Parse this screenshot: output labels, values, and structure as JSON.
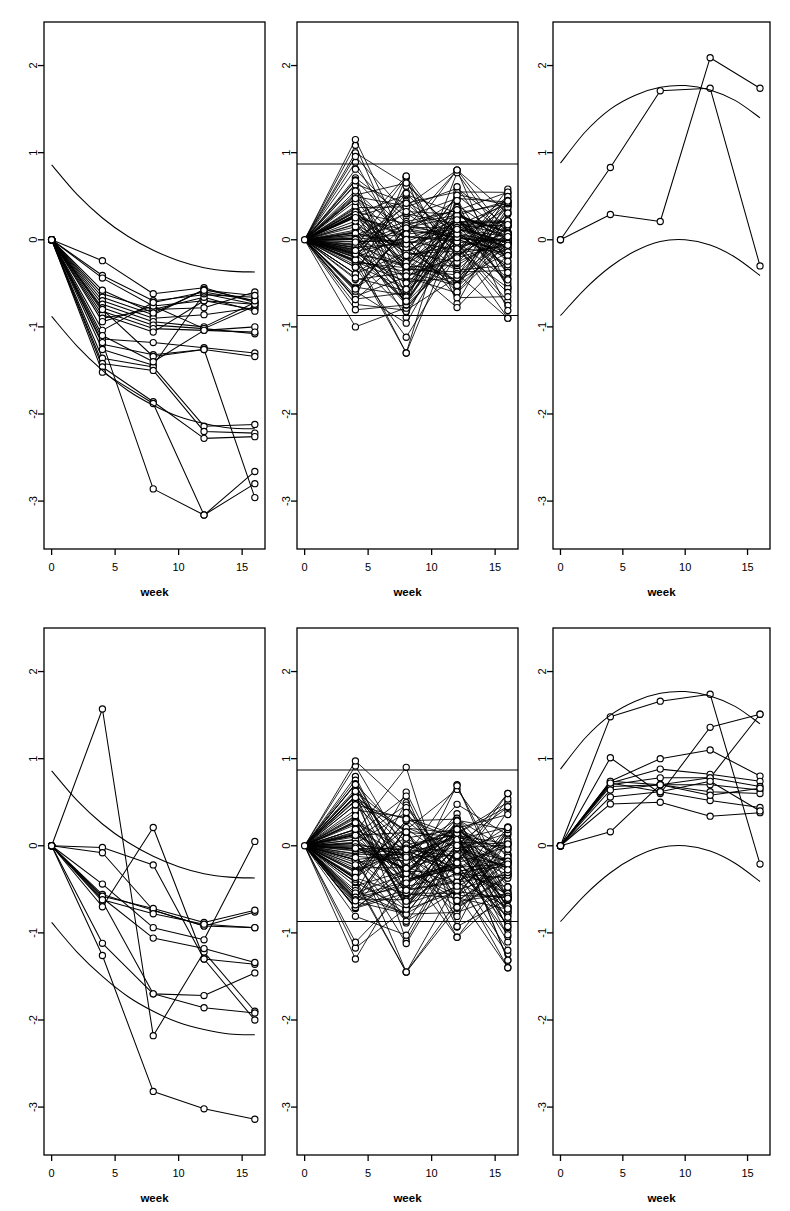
{
  "figure": {
    "panel_rows": 2,
    "panel_cols": 3,
    "background": "#ffffff",
    "ink": "#000000"
  },
  "chart_data": [
    {
      "id": "panel-top-left",
      "type": "line",
      "title": "",
      "xlabel": "week",
      "ylabel": "",
      "xlim": [
        -0.6,
        16.8
      ],
      "ylim": [
        -3.55,
        2.5
      ],
      "xticks": [
        0,
        5,
        10,
        15
      ],
      "xticklabels": [
        "0",
        "5",
        "10",
        "15"
      ],
      "yticks": [
        2,
        1,
        0,
        -1,
        -2,
        -3
      ],
      "yticklabels": [
        "2",
        "1",
        "0",
        "-1",
        "-2",
        "-3"
      ],
      "grid": false,
      "legend": "none",
      "marker": "open-circle",
      "x": [
        0,
        4,
        8,
        12,
        16
      ],
      "envelopes": [
        {
          "name": "upper",
          "x": [
            0,
            2,
            4,
            6,
            8,
            10,
            12,
            14,
            16
          ],
          "y": [
            0.86,
            0.52,
            0.25,
            0.04,
            -0.12,
            -0.24,
            -0.32,
            -0.36,
            -0.37
          ]
        },
        {
          "name": "lower",
          "x": [
            0,
            2,
            4,
            6,
            8,
            10,
            12,
            14,
            16
          ],
          "y": [
            -0.88,
            -1.22,
            -1.5,
            -1.73,
            -1.9,
            -2.03,
            -2.11,
            -2.16,
            -2.17
          ]
        }
      ],
      "series": [
        {
          "name": "s1",
          "values": [
            0,
            -0.24,
            -0.62,
            -0.55,
            -0.72
          ]
        },
        {
          "name": "s2",
          "values": [
            0,
            -0.41,
            -0.7,
            -0.63,
            -0.66
          ]
        },
        {
          "name": "s3",
          "values": [
            0,
            -0.44,
            -0.76,
            -0.7,
            -0.74
          ]
        },
        {
          "name": "s4",
          "values": [
            0,
            -0.62,
            -0.8,
            -0.78,
            -0.6
          ]
        },
        {
          "name": "s5",
          "values": [
            0,
            -0.66,
            -0.86,
            -0.57,
            -0.7
          ]
        },
        {
          "name": "s6",
          "values": [
            0,
            -0.7,
            -0.9,
            -0.86,
            -0.78
          ]
        },
        {
          "name": "s7",
          "values": [
            0,
            -0.74,
            -0.94,
            -1.0,
            -0.72
          ]
        },
        {
          "name": "s8",
          "values": [
            0,
            -0.78,
            -0.98,
            -1.02,
            -0.76
          ]
        },
        {
          "name": "s9",
          "values": [
            0,
            -0.82,
            -1.02,
            -1.04,
            -1.0
          ]
        },
        {
          "name": "s10",
          "values": [
            0,
            -0.86,
            -1.06,
            -0.7,
            -0.8
          ]
        },
        {
          "name": "s11",
          "values": [
            0,
            -0.9,
            -0.8,
            -0.66,
            -0.82
          ]
        },
        {
          "name": "s12",
          "values": [
            0,
            -0.94,
            -0.76,
            -1.02,
            -1.08
          ]
        },
        {
          "name": "s13",
          "values": [
            0,
            -1.14,
            -1.18,
            -1.24,
            -1.3
          ]
        },
        {
          "name": "s14",
          "values": [
            0,
            -1.2,
            -1.32,
            -1.26,
            -1.34
          ]
        },
        {
          "name": "s15",
          "values": [
            0,
            -1.26,
            -1.44,
            -0.62,
            -0.74
          ]
        },
        {
          "name": "s16",
          "values": [
            0,
            -1.36,
            -1.46,
            -2.14,
            -2.12
          ]
        },
        {
          "name": "s17",
          "values": [
            0,
            -1.42,
            -1.5,
            -2.2,
            -2.22
          ]
        },
        {
          "name": "s18",
          "values": [
            0,
            -1.46,
            -1.86,
            -2.28,
            -2.26
          ]
        },
        {
          "name": "s19",
          "values": [
            0,
            -1.52,
            -1.88,
            -3.16,
            -2.66
          ]
        },
        {
          "name": "s20",
          "values": [
            0,
            -1.18,
            -2.86,
            -3.16,
            -2.8
          ]
        },
        {
          "name": "s21",
          "values": [
            0,
            -0.8,
            -1.34,
            -1.26,
            -2.96
          ]
        },
        {
          "name": "s22",
          "values": [
            0,
            -1.04,
            -0.72,
            -0.6,
            -0.7
          ]
        },
        {
          "name": "s23",
          "values": [
            0,
            -0.58,
            -0.84,
            -0.58,
            -0.64
          ]
        },
        {
          "name": "s24",
          "values": [
            0,
            -1.1,
            -1.4,
            -1.04,
            -1.06
          ]
        }
      ]
    },
    {
      "id": "panel-top-middle",
      "type": "line",
      "title": "",
      "xlabel": "week",
      "ylabel": "",
      "xlim": [
        -0.6,
        16.8
      ],
      "ylim": [
        -3.55,
        2.5
      ],
      "xticks": [
        0,
        5,
        10,
        15
      ],
      "xticklabels": [
        "0",
        "5",
        "10",
        "15"
      ],
      "yticks": [
        2,
        1,
        0,
        -1,
        -2,
        -3
      ],
      "yticklabels": [
        "2",
        "1",
        "0",
        "-1",
        "-2",
        "-3"
      ],
      "grid": false,
      "legend": "none",
      "marker": "open-circle",
      "x": [
        0,
        4,
        8,
        12,
        16
      ],
      "reference_lines": [
        0.87,
        -0.87
      ],
      "spaghetti_note": "dense null-simulation bundle, ~100 trajectories spreading from 0 within roughly +/-1.3",
      "n_series": 100,
      "spread": {
        "week4": [
          -1.0,
          1.15
        ],
        "week8": [
          -1.3,
          1.0
        ],
        "week12": [
          -0.9,
          0.8
        ],
        "week16": [
          -0.9,
          0.82
        ]
      }
    },
    {
      "id": "panel-top-right",
      "type": "line",
      "title": "",
      "xlabel": "week",
      "ylabel": "",
      "xlim": [
        -0.6,
        16.8
      ],
      "ylim": [
        -3.55,
        2.5
      ],
      "xticks": [
        0,
        5,
        10,
        15
      ],
      "xticklabels": [
        "0",
        "5",
        "10",
        "15"
      ],
      "yticks": [
        2,
        1,
        0,
        -1,
        -2,
        -3
      ],
      "yticklabels": [
        "2",
        "1",
        "0",
        "-1",
        "-2",
        "-3"
      ],
      "grid": false,
      "legend": "none",
      "marker": "open-circle",
      "x": [
        0,
        4,
        8,
        12,
        16
      ],
      "envelopes": [
        {
          "name": "upper",
          "x": [
            0,
            2,
            4,
            6,
            8,
            10,
            12,
            14,
            16
          ],
          "y": [
            0.88,
            1.24,
            1.5,
            1.66,
            1.75,
            1.77,
            1.72,
            1.6,
            1.4
          ]
        },
        {
          "name": "lower",
          "x": [
            0,
            2,
            4,
            6,
            8,
            10,
            12,
            14,
            16
          ],
          "y": [
            -0.87,
            -0.56,
            -0.31,
            -0.13,
            -0.02,
            0.0,
            -0.06,
            -0.2,
            -0.41
          ]
        }
      ],
      "series": [
        {
          "name": "s1",
          "values": [
            0,
            0.83,
            1.71,
            1.74,
            -0.3
          ]
        },
        {
          "name": "s2",
          "values": [
            0,
            0.29,
            0.21,
            2.09,
            1.74
          ]
        }
      ]
    },
    {
      "id": "panel-bottom-left",
      "type": "line",
      "title": "",
      "xlabel": "week",
      "ylabel": "",
      "xlim": [
        -0.6,
        16.8
      ],
      "ylim": [
        -3.55,
        2.5
      ],
      "xticks": [
        0,
        5,
        10,
        15
      ],
      "xticklabels": [
        "0",
        "5",
        "10",
        "15"
      ],
      "yticks": [
        2,
        1,
        0,
        -1,
        -2,
        -3
      ],
      "yticklabels": [
        "2",
        "1",
        "0",
        "-1",
        "-2",
        "-3"
      ],
      "grid": false,
      "legend": "none",
      "marker": "open-circle",
      "x": [
        0,
        4,
        8,
        12,
        16
      ],
      "envelopes": [
        {
          "name": "upper",
          "x": [
            0,
            2,
            4,
            6,
            8,
            10,
            12,
            14,
            16
          ],
          "y": [
            0.86,
            0.52,
            0.25,
            0.04,
            -0.12,
            -0.24,
            -0.32,
            -0.36,
            -0.37
          ]
        },
        {
          "name": "lower",
          "x": [
            0,
            2,
            4,
            6,
            8,
            10,
            12,
            14,
            16
          ],
          "y": [
            -0.88,
            -1.22,
            -1.5,
            -1.73,
            -1.9,
            -2.03,
            -2.11,
            -2.16,
            -2.17
          ]
        }
      ],
      "series": [
        {
          "name": "s1",
          "values": [
            0,
            1.57,
            -2.18,
            -1.22,
            -1.9
          ]
        },
        {
          "name": "s2",
          "values": [
            0,
            -0.02,
            -0.22,
            -1.3,
            -1.36
          ]
        },
        {
          "name": "s3",
          "values": [
            0,
            -0.08,
            -0.74,
            -0.92,
            -0.94
          ]
        },
        {
          "name": "s4",
          "values": [
            0,
            -0.44,
            -0.94,
            -1.08,
            0.05
          ]
        },
        {
          "name": "s5",
          "values": [
            0,
            -0.56,
            -0.74,
            -0.92,
            -0.76
          ]
        },
        {
          "name": "s6",
          "values": [
            0,
            -0.6,
            -1.06,
            -1.18,
            -1.34
          ]
        },
        {
          "name": "s7",
          "values": [
            0,
            -0.64,
            -1.7,
            -1.72,
            -1.46
          ]
        },
        {
          "name": "s8",
          "values": [
            0,
            -0.7,
            0.21,
            -1.3,
            -2.0
          ]
        },
        {
          "name": "s9",
          "values": [
            0,
            -1.12,
            -1.7,
            -1.86,
            -1.92
          ]
        },
        {
          "name": "s10",
          "values": [
            0,
            -1.26,
            -2.82,
            -3.02,
            -3.14
          ]
        },
        {
          "name": "s11",
          "values": [
            0,
            -0.58,
            -0.72,
            -0.88,
            -0.74
          ]
        },
        {
          "name": "s12",
          "values": [
            0,
            -0.62,
            -0.78,
            -0.9,
            -0.94
          ]
        }
      ]
    },
    {
      "id": "panel-bottom-middle",
      "type": "line",
      "title": "",
      "xlabel": "week",
      "ylabel": "",
      "xlim": [
        -0.6,
        16.8
      ],
      "ylim": [
        -3.55,
        2.5
      ],
      "xticks": [
        0,
        5,
        10,
        15
      ],
      "xticklabels": [
        "0",
        "5",
        "10",
        "15"
      ],
      "yticks": [
        2,
        1,
        0,
        -1,
        -2,
        -3
      ],
      "yticklabels": [
        "2",
        "1",
        "0",
        "-1",
        "-2",
        "-3"
      ],
      "grid": false,
      "legend": "none",
      "marker": "open-circle",
      "x": [
        0,
        4,
        8,
        12,
        16
      ],
      "reference_lines": [
        0.87,
        -0.87
      ],
      "spaghetti_note": "dense null-simulation bundle, ~100 trajectories spreading from 0 within roughly +/-1.45",
      "n_series": 100,
      "spread": {
        "week4": [
          -1.3,
          1.1
        ],
        "week8": [
          -1.45,
          0.9
        ],
        "week12": [
          -1.05,
          0.7
        ],
        "week16": [
          -1.4,
          0.6
        ]
      }
    },
    {
      "id": "panel-bottom-right",
      "type": "line",
      "title": "",
      "xlabel": "week",
      "ylabel": "",
      "xlim": [
        -0.6,
        16.8
      ],
      "ylim": [
        -3.55,
        2.5
      ],
      "xticks": [
        0,
        5,
        10,
        15
      ],
      "xticklabels": [
        "0",
        "5",
        "10",
        "15"
      ],
      "yticks": [
        2,
        1,
        0,
        -1,
        -2,
        -3
      ],
      "yticklabels": [
        "2",
        "1",
        "0",
        "-1",
        "-2",
        "-3"
      ],
      "grid": false,
      "legend": "none",
      "marker": "open-circle",
      "x": [
        0,
        4,
        8,
        12,
        16
      ],
      "envelopes": [
        {
          "name": "upper",
          "x": [
            0,
            2,
            4,
            6,
            8,
            10,
            12,
            14,
            16
          ],
          "y": [
            0.88,
            1.24,
            1.5,
            1.66,
            1.75,
            1.77,
            1.72,
            1.6,
            1.4
          ]
        },
        {
          "name": "lower",
          "x": [
            0,
            2,
            4,
            6,
            8,
            10,
            12,
            14,
            16
          ],
          "y": [
            -0.87,
            -0.56,
            -0.31,
            -0.13,
            -0.02,
            0.0,
            -0.06,
            -0.2,
            -0.41
          ]
        }
      ],
      "series": [
        {
          "name": "s1",
          "values": [
            0,
            1.48,
            1.66,
            1.74,
            -0.21
          ]
        },
        {
          "name": "s2",
          "values": [
            0,
            1.01,
            0.6,
            1.36,
            1.51
          ]
        },
        {
          "name": "s3",
          "values": [
            0,
            0.74,
            1.0,
            1.1,
            0.8
          ]
        },
        {
          "name": "s4",
          "values": [
            0,
            0.72,
            0.88,
            0.82,
            0.74
          ]
        },
        {
          "name": "s5",
          "values": [
            0,
            0.7,
            0.78,
            0.78,
            0.68
          ]
        },
        {
          "name": "s6",
          "values": [
            0,
            0.68,
            0.7,
            0.7,
            0.64
          ]
        },
        {
          "name": "s7",
          "values": [
            0,
            0.64,
            0.7,
            0.62,
            0.6
          ]
        },
        {
          "name": "s8",
          "values": [
            0,
            0.56,
            0.62,
            0.52,
            0.44
          ]
        },
        {
          "name": "s9",
          "values": [
            0,
            0.48,
            0.5,
            0.34,
            0.38
          ]
        },
        {
          "name": "s10",
          "values": [
            0,
            0.16,
            0.7,
            0.78,
            1.51
          ]
        },
        {
          "name": "s11",
          "values": [
            0,
            0.74,
            0.7,
            0.58,
            0.66
          ]
        },
        {
          "name": "s12",
          "values": [
            0,
            0.72,
            0.62,
            0.74,
            0.4
          ]
        }
      ]
    }
  ],
  "labels": {
    "xaxis_title": "week",
    "xticks": [
      "0",
      "5",
      "10",
      "15"
    ],
    "yticks": [
      "2",
      "1",
      "0",
      "-1",
      "-2",
      "-3"
    ]
  }
}
